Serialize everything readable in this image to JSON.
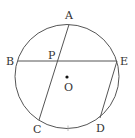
{
  "diagram": {
    "type": "circle-geometry",
    "colors": {
      "stroke": "#555555",
      "text": "#333333",
      "background": "#ffffff",
      "tick": "#aaaaaa"
    },
    "circle": {
      "cx": 67,
      "cy": 76.5,
      "r": 52
    },
    "center": {
      "label": "O",
      "x": 67,
      "y": 77,
      "label_x": 64,
      "label_y": 91
    },
    "points": [
      {
        "id": "A",
        "label": "A",
        "x": 69,
        "y": 24.5,
        "label_x": 65,
        "label_y": 19
      },
      {
        "id": "B",
        "label": "B",
        "x": 18,
        "y": 61,
        "label_x": 6,
        "label_y": 65
      },
      {
        "id": "E",
        "label": "E",
        "x": 117,
        "y": 61,
        "label_x": 120,
        "label_y": 65
      },
      {
        "id": "C",
        "label": "C",
        "x": 39,
        "y": 120,
        "label_x": 33,
        "label_y": 133
      },
      {
        "id": "D",
        "label": "D",
        "x": 100,
        "y": 118,
        "label_x": 96,
        "label_y": 132
      },
      {
        "id": "P",
        "label": "P",
        "x": 57,
        "y": 61,
        "label_x": 48,
        "label_y": 59
      }
    ],
    "segments": [
      {
        "name": "chord-BE",
        "from": "B",
        "to": "E",
        "x1": 18,
        "y1": 61,
        "x2": 117,
        "y2": 61
      },
      {
        "name": "chord-AC",
        "from": "A",
        "to": "C",
        "x1": 69,
        "y1": 24.5,
        "x2": 39,
        "y2": 120
      },
      {
        "name": "chord-ED",
        "from": "E",
        "to": "D",
        "x1": 117,
        "y1": 61,
        "x2": 100,
        "y2": 118
      }
    ],
    "tick_marks": [
      {
        "name": "arc-tick-CD",
        "x1": 68,
        "y1": 125.5,
        "x2": 68,
        "y2": 131
      }
    ]
  }
}
